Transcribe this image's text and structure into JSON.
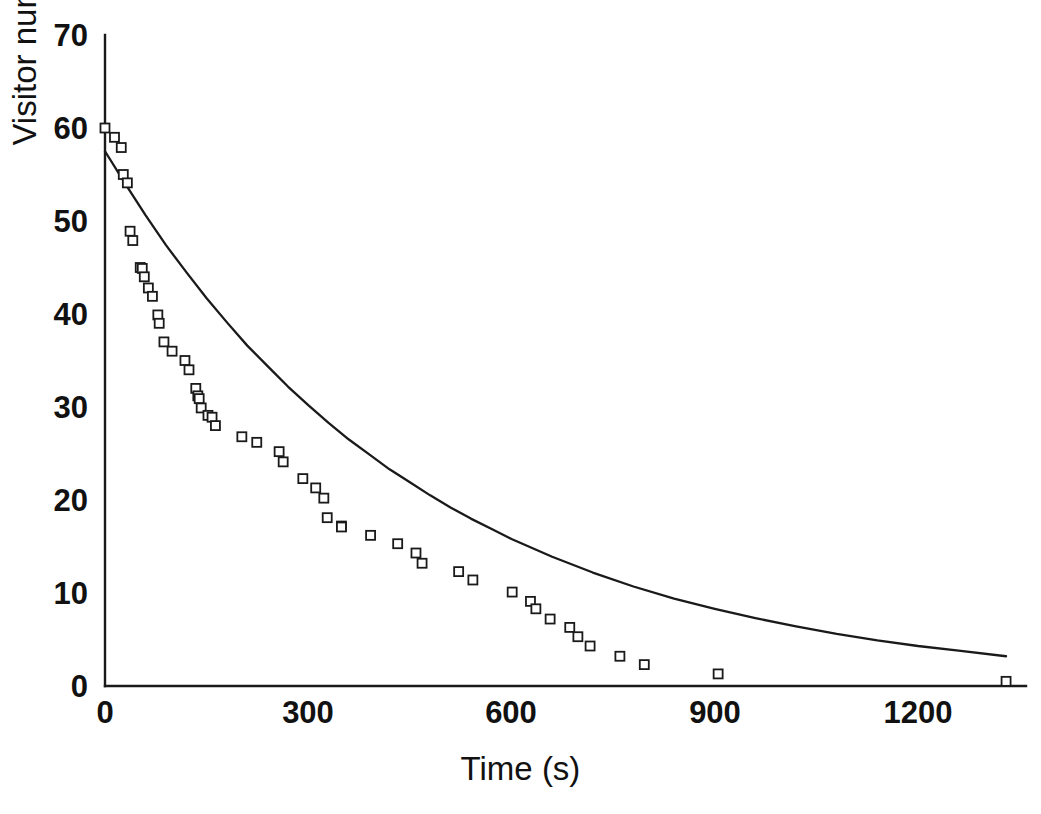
{
  "chart_data": {
    "type": "scatter",
    "title": "",
    "xlabel": "Time (s)",
    "ylabel": "Visitor number",
    "xlim": [
      0,
      1360
    ],
    "ylim": [
      0,
      70
    ],
    "xticks": [
      0,
      300,
      600,
      900,
      1200
    ],
    "xtick_labels": [
      "0",
      "300",
      "600",
      "900",
      "1200"
    ],
    "yticks": [
      0,
      10,
      20,
      30,
      40,
      50,
      60,
      70
    ],
    "ytick_labels": [
      "0",
      "10",
      "20",
      "30",
      "40",
      "50",
      "60",
      "70"
    ],
    "grid": false,
    "legend": null,
    "marker": "open-square",
    "marker_size_px": 9,
    "series": [
      {
        "name": "Visitor number (observed)",
        "type": "scatter",
        "points": [
          [
            0,
            60.0
          ],
          [
            14,
            59.0
          ],
          [
            24,
            57.9
          ],
          [
            27,
            55.0
          ],
          [
            33,
            54.1
          ],
          [
            37,
            48.9
          ],
          [
            41,
            47.9
          ],
          [
            52,
            45.0
          ],
          [
            55,
            44.9
          ],
          [
            58,
            44.0
          ],
          [
            64,
            42.8
          ],
          [
            70,
            41.9
          ],
          [
            78,
            39.9
          ],
          [
            80,
            39.0
          ],
          [
            87,
            37.0
          ],
          [
            99,
            36.0
          ],
          [
            118,
            35.0
          ],
          [
            124,
            34.0
          ],
          [
            134,
            32.0
          ],
          [
            137,
            31.2
          ],
          [
            139,
            30.9
          ],
          [
            142,
            29.9
          ],
          [
            152,
            29.1
          ],
          [
            158,
            28.9
          ],
          [
            163,
            28.0
          ],
          [
            202,
            26.8
          ],
          [
            224,
            26.2
          ],
          [
            257,
            25.2
          ],
          [
            263,
            24.1
          ],
          [
            292,
            22.3
          ],
          [
            311,
            21.3
          ],
          [
            323,
            20.2
          ],
          [
            328,
            18.1
          ],
          [
            349,
            17.2
          ],
          [
            349,
            17.1
          ],
          [
            392,
            16.2
          ],
          [
            432,
            15.3
          ],
          [
            459,
            14.3
          ],
          [
            468,
            13.2
          ],
          [
            522,
            12.3
          ],
          [
            543,
            11.4
          ],
          [
            601,
            10.1
          ],
          [
            628,
            9.1
          ],
          [
            636,
            8.3
          ],
          [
            657,
            7.2
          ],
          [
            686,
            6.3
          ],
          [
            698,
            5.3
          ],
          [
            716,
            4.3
          ],
          [
            760,
            3.2
          ],
          [
            796,
            2.3
          ],
          [
            905,
            1.3
          ],
          [
            1330,
            0.5
          ]
        ]
      },
      {
        "name": "Exponential fit",
        "type": "line",
        "model": "single-exponential decay",
        "y0": 57.5,
        "points": [
          [
            0,
            57.5
          ],
          [
            30,
            54.0
          ],
          [
            60,
            50.6
          ],
          [
            90,
            47.4
          ],
          [
            120,
            44.5
          ],
          [
            150,
            41.7
          ],
          [
            180,
            39.1
          ],
          [
            210,
            36.6
          ],
          [
            240,
            34.4
          ],
          [
            270,
            32.2
          ],
          [
            300,
            30.2
          ],
          [
            330,
            28.3
          ],
          [
            360,
            26.5
          ],
          [
            390,
            24.9
          ],
          [
            420,
            23.3
          ],
          [
            450,
            21.9
          ],
          [
            480,
            20.5
          ],
          [
            510,
            19.2
          ],
          [
            540,
            18.0
          ],
          [
            570,
            16.9
          ],
          [
            600,
            15.8
          ],
          [
            660,
            13.9
          ],
          [
            720,
            12.2
          ],
          [
            780,
            10.7
          ],
          [
            840,
            9.4
          ],
          [
            900,
            8.3
          ],
          [
            960,
            7.3
          ],
          [
            1020,
            6.4
          ],
          [
            1080,
            5.6
          ],
          [
            1140,
            4.9
          ],
          [
            1200,
            4.3
          ],
          [
            1260,
            3.8
          ],
          [
            1330,
            3.2
          ]
        ]
      }
    ]
  },
  "axes": {
    "x_title": "Time (s)",
    "y_title": "Visitor number"
  }
}
